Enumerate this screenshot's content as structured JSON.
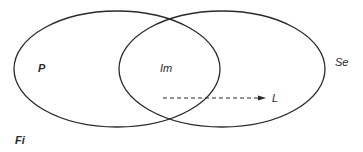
{
  "diagram": {
    "type": "venn",
    "sets": [
      {
        "id": "P",
        "label": "P"
      },
      {
        "id": "Se",
        "label": "Se"
      }
    ],
    "intersection": {
      "label": "Im"
    },
    "arrow": {
      "label": "L",
      "style": "dashed",
      "direction": "right"
    },
    "figure_label": "Fi"
  },
  "colors": {
    "stroke": "#2a2a2a",
    "background": "#ffffff"
  }
}
